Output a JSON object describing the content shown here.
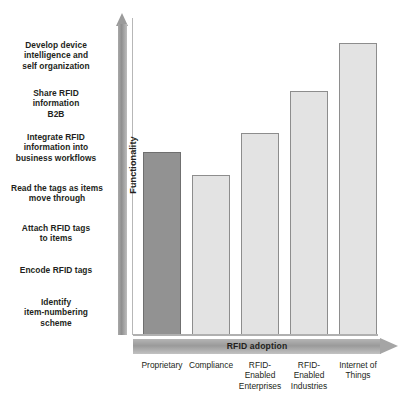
{
  "chart_data": {
    "type": "bar",
    "title": "",
    "xlabel": "RFID adoption",
    "ylabel": "Functionality",
    "categories": [
      "Proprietary",
      "Compliance",
      "RFID-\nEnabled\nEnterprises",
      "RFID-\nEnabled\nIndustries",
      "Internet of\nThings"
    ],
    "values": [
      57,
      50,
      63,
      76,
      91
    ],
    "ylim": [
      0,
      100
    ],
    "grid": false,
    "legend": null,
    "bar_colors": [
      "#929292",
      "#e3e3e3",
      "#e3e3e3",
      "#e3e3e3",
      "#e3e3e3"
    ],
    "highlight_index": 0,
    "stage_annotations": [
      "Develop device\nintelligence and\nself organization",
      "Share RFID\ninformation\nB2B",
      "Integrate RFID\ninformation into\nbusiness workflows",
      "Read the tags as items\nmove through",
      "Attach RFID tags\nto items",
      "Encode RFID tags",
      "Identify\nitem-numbering\nscheme"
    ]
  },
  "axes": {
    "y_title": "Functionality",
    "x_title": "RFID adoption"
  },
  "stages": [
    {
      "text": "Develop device intelligence and self organization",
      "lines": [
        "Develop device",
        "intelligence and",
        "self organization"
      ]
    },
    {
      "text": "Share RFID information B2B",
      "lines": [
        "Share RFID",
        "information",
        "B2B"
      ]
    },
    {
      "text": "Integrate RFID information into business workflows",
      "lines": [
        "Integrate RFID",
        "information into",
        "business workflows"
      ]
    },
    {
      "text": "Read the tags as items move through",
      "lines": [
        "Read the tags as items",
        "move through"
      ]
    },
    {
      "text": "Attach RFID tags to items",
      "lines": [
        "Attach RFID tags",
        "to items"
      ]
    },
    {
      "text": "Encode RFID tags",
      "lines": [
        "Encode RFID tags"
      ]
    },
    {
      "text": "Identify item-numbering scheme",
      "lines": [
        "Identify",
        "item-numbering",
        "scheme"
      ]
    }
  ],
  "categories": [
    {
      "lines": [
        "Proprietary"
      ]
    },
    {
      "lines": [
        "Compliance"
      ]
    },
    {
      "lines": [
        "RFID-",
        "Enabled",
        "Enterprises"
      ]
    },
    {
      "lines": [
        "RFID-",
        "Enabled",
        "Industries"
      ]
    },
    {
      "lines": [
        "Internet of",
        "Things"
      ]
    }
  ],
  "bars": [
    {
      "name": "Proprietary",
      "value": 57,
      "color": "#929292",
      "highlight": true
    },
    {
      "name": "Compliance",
      "value": 50,
      "color": "#e3e3e3",
      "highlight": false
    },
    {
      "name": "RFID-Enabled Enterprises",
      "value": 63,
      "color": "#e3e3e3",
      "highlight": false
    },
    {
      "name": "RFID-Enabled Industries",
      "value": 76,
      "color": "#e3e3e3",
      "highlight": false
    },
    {
      "name": "Internet of Things",
      "value": 91,
      "color": "#e3e3e3",
      "highlight": false
    }
  ],
  "colors": {
    "highlight_bar": "#929292",
    "bar": "#e3e3e3",
    "bar_border": "#8d8d8d",
    "axis_arrow": "#9b9b9b",
    "text": "#231f20",
    "background": "#ffffff"
  }
}
